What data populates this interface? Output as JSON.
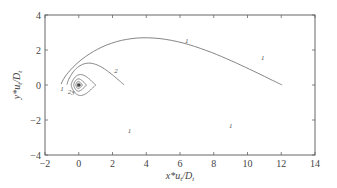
{
  "chart_data": {
    "type": "contour",
    "title": "",
    "xlabel": "x*u_t/D_t",
    "ylabel": "y*u_t/D_t",
    "xlim": [
      -2,
      14
    ],
    "ylim": [
      -4,
      4
    ],
    "xticks": [
      -2,
      0,
      2,
      4,
      6,
      8,
      10,
      12,
      14
    ],
    "yticks": [
      -4,
      -2,
      0,
      2,
      4
    ],
    "grid": false,
    "legend": null,
    "source_point": [
      0,
      0
    ],
    "contours": [
      {
        "label": "1",
        "x_min": -1.05,
        "x_max": 12.05,
        "y_half_width": 2.7
      },
      {
        "label": "2",
        "x_min": -0.7,
        "x_max": 2.7,
        "y_half_width": 1.25
      },
      {
        "label": "3",
        "x_min": -0.45,
        "x_max": 1.0,
        "y_half_width": 0.6
      },
      {
        "label": "4",
        "x_min": -0.3,
        "x_max": 0.45,
        "y_half_width": 0.35
      },
      {
        "label": "5",
        "x_min": -0.18,
        "x_max": 0.22,
        "y_half_width": 0.2
      },
      {
        "label": "6",
        "x_min": -0.1,
        "x_max": 0.12,
        "y_half_width": 0.11
      }
    ]
  },
  "axes": {
    "xlabel_main": "x*u",
    "xlabel_sub1": "t",
    "xlabel_mid": "/D",
    "xlabel_sub2": "t",
    "ylabel_main": "y*u",
    "ylabel_sub1": "t",
    "ylabel_mid": "/D",
    "ylabel_sub2": "t"
  }
}
